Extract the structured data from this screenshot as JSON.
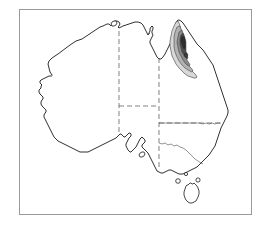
{
  "figure": {
    "kind": "distribution-map",
    "region": "Australia",
    "title": "",
    "caption": "",
    "background_color": "#ffffff",
    "frame": {
      "visible": true,
      "color": "#9a9a9a",
      "x": 19,
      "y": 9,
      "width": 233,
      "height": 206
    }
  },
  "map": {
    "outline_color": "#1a1a1a",
    "fill_color": "#ffffff",
    "border_color": "#4a4a4a",
    "border_style": "dashed",
    "landmasses": [
      {
        "name": "mainland-australia",
        "label": ""
      },
      {
        "name": "tasmania",
        "label": ""
      },
      {
        "name": "kangaroo-island",
        "label": ""
      },
      {
        "name": "melville-island",
        "label": ""
      },
      {
        "name": "king-island",
        "label": ""
      },
      {
        "name": "flinders-island",
        "label": ""
      }
    ],
    "state_borders": [
      {
        "name": "wa-nt-sa-border",
        "style": "dashed"
      },
      {
        "name": "nt-sa-border",
        "style": "dashed"
      },
      {
        "name": "nt-qld-border",
        "style": "dashed"
      },
      {
        "name": "sa-qld-nsw-border",
        "style": "dashed"
      },
      {
        "name": "qld-nsw-border",
        "style": "solid"
      },
      {
        "name": "nsw-vic-border",
        "style": "solid"
      }
    ]
  },
  "shaded_zone": {
    "name": "distribution-zone",
    "location": "north-east-queensland",
    "label": "",
    "contour_levels": [
      {
        "name": "outer",
        "color": "#d8d8d8"
      },
      {
        "name": "mid",
        "color": "#b2b2b2"
      },
      {
        "name": "inner",
        "color": "#8a8a8a"
      },
      {
        "name": "core",
        "color": "#4e4e4e"
      },
      {
        "name": "peak",
        "color": "#2e2e2e"
      }
    ]
  },
  "legend": {
    "visible": false,
    "entries": []
  },
  "annotations": []
}
